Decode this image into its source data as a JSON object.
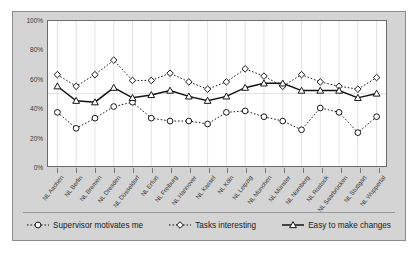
{
  "chart_data": {
    "type": "line",
    "title": "",
    "subtitle": "",
    "xlabel": "",
    "ylabel": "",
    "ylim": [
      0,
      100
    ],
    "ytick_labels": [
      "100%",
      "80%",
      "60%",
      "40%",
      "20%",
      "0%"
    ],
    "ytick_values": [
      100,
      80,
      60,
      40,
      20,
      0
    ],
    "grid": "vertical",
    "legend_position": "bottom",
    "categories": [
      "NL Aachen",
      "NL Berlin",
      "NL Bremen",
      "NL Dresden",
      "NL Düsseldorf",
      "NL Erfurt",
      "NL Freiburg",
      "NL Hannover",
      "NL Kassel",
      "NL Köln",
      "NL Leipzig",
      "NL München",
      "NL Münster",
      "NL Nürnberg",
      "NL Rostock",
      "NL Saarbrücken",
      "NL Stuttgart",
      "NL Wuppertal"
    ],
    "series": [
      {
        "name": "Supervisor motivates me",
        "marker": "circle",
        "line_style": "dotted",
        "color": "#1a1a1a",
        "values": [
          37,
          26,
          33,
          41,
          44,
          33,
          31,
          31,
          29,
          37,
          38,
          34,
          31,
          25,
          40,
          37,
          23,
          34
        ]
      },
      {
        "name": "Tasks interesting",
        "marker": "diamond",
        "line_style": "dotted",
        "color": "#1a1a1a",
        "values": [
          63,
          55,
          63,
          73,
          59,
          59,
          64,
          58,
          53,
          58,
          67,
          62,
          55,
          63,
          58,
          55,
          53,
          61
        ]
      },
      {
        "name": "Easy to make changes",
        "marker": "triangle",
        "line_style": "solid",
        "color": "#111111",
        "values": [
          55,
          45,
          44,
          54,
          47,
          49,
          52,
          48,
          45,
          48,
          54,
          57,
          57,
          52,
          52,
          52,
          47,
          50
        ]
      }
    ]
  },
  "legend": {
    "items": [
      {
        "label": "Supervisor motivates me",
        "marker": "circle-marker-icon"
      },
      {
        "label": "Tasks interesting",
        "marker": "diamond-marker-icon"
      },
      {
        "label": "Easy to make changes",
        "marker": "triangle-marker-icon"
      }
    ]
  },
  "colors": {
    "figure_background": "#d4d4d4",
    "plot_background": "#ffffff",
    "plot_border": "#6b6b6b",
    "gridline": "#e2e2e2",
    "text": "#3a3a3a"
  }
}
